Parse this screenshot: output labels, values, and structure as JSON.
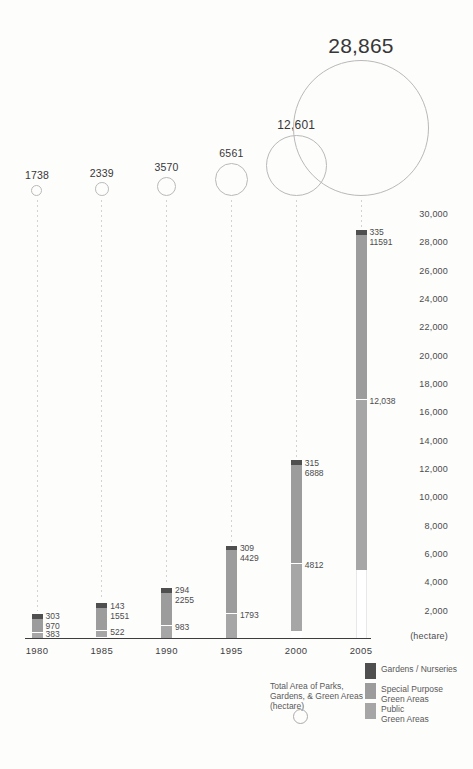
{
  "chart_data": {
    "type": "bar",
    "subtype": "stacked-bars-with-total-bubbles",
    "categories": [
      "1980",
      "1985",
      "1990",
      "1995",
      "2000",
      "2005"
    ],
    "totals": {
      "values": [
        1738,
        2339,
        3570,
        6561,
        12601,
        28865
      ],
      "labels": [
        "1738",
        "2339",
        "3570",
        "6561",
        "12,601",
        "28,865"
      ]
    },
    "series": [
      {
        "name": "Gardens / Nurseries",
        "color": "#4f4f4f",
        "values": [
          303,
          143,
          294,
          309,
          315,
          335
        ],
        "labels": [
          "303",
          "143",
          "294",
          "309",
          "315",
          "335"
        ]
      },
      {
        "name": "Special Purpose Green Areas",
        "color": "#9c9c9c",
        "values": [
          970,
          1551,
          2255,
          4429,
          6888,
          11591
        ],
        "labels": [
          "970",
          "1551",
          "2255",
          "4429",
          "6888",
          "11591"
        ]
      },
      {
        "name": "Public Green Areas",
        "color": "#a6a6a6",
        "values": [
          383,
          522,
          983,
          1793,
          4812,
          12038
        ],
        "labels": [
          "383",
          "522",
          "983",
          "1793",
          "4812",
          "12,038"
        ]
      }
    ],
    "unlabeled_remainder_note": "white bottom segment = parks remainder of total",
    "y_axis": {
      "range": [
        0,
        30000
      ],
      "tick_values": [
        30000,
        28000,
        26000,
        24000,
        22000,
        20000,
        18000,
        16000,
        14000,
        12000,
        10000,
        8000,
        6000,
        4000,
        2000
      ],
      "tick_labels": [
        "30,000",
        "28,000",
        "26,000",
        "24,000",
        "22,000",
        "20,000",
        "18,000",
        "16,000",
        "14,000",
        "12,000",
        "10,000",
        "8,000",
        "6,000",
        "4,000",
        "2,000"
      ],
      "unit_label": "(hectare)"
    },
    "grid": "off",
    "legend_position": "bottom-right"
  },
  "legend": {
    "items": [
      {
        "lines": [
          "Gardens / Nurseries"
        ],
        "color": "#4f4f4f"
      },
      {
        "lines": [
          "Special Purpose",
          "Green Areas"
        ],
        "color": "#9c9c9c"
      },
      {
        "lines": [
          "Public",
          "Green Areas"
        ],
        "color": "#a6a6a6"
      }
    ],
    "bubble_caption_lines": [
      "Total Area of Parks,",
      "Gardens, & Green Areas",
      "(hectare)"
    ]
  },
  "colors": {
    "bubble_stroke": "#b9b9b9",
    "guide_dash": "#d3d3d3",
    "axis_line": "#3d3d3d",
    "text_dark": "#373737",
    "text_mid": "#4c4c4c",
    "text_legend": "#595959",
    "remainder_fill": "#ffffff",
    "remainder_edge": "#e8e8e8"
  }
}
